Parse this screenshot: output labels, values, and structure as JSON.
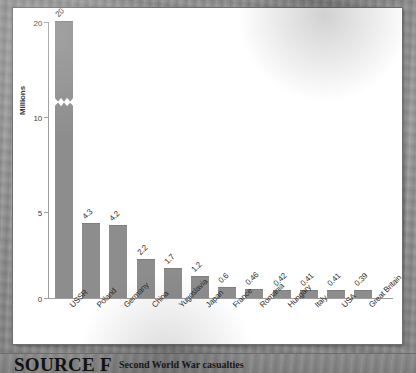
{
  "source": {
    "label": "SOURCE F",
    "caption": "Second World War casualties"
  },
  "chart_data": {
    "type": "bar",
    "title": "",
    "xlabel": "",
    "ylabel": "Millions",
    "ylim": [
      0,
      20
    ],
    "y_ticks": [
      "0",
      "5",
      "10",
      "20"
    ],
    "axis_break": {
      "present": true,
      "between": [
        10,
        20
      ],
      "note": "y-axis broken between 10 and 20; USSR bar drawn with zigzag break"
    },
    "grid": false,
    "legend": "none",
    "categories": [
      "USSR",
      "Poland",
      "Germany",
      "China",
      "Yugoslavia",
      "Japan",
      "France",
      "Romania",
      "Hungary",
      "Italy",
      "USA",
      "Great Britain"
    ],
    "values": [
      20,
      4.3,
      4.2,
      2.2,
      1.7,
      1.2,
      0.6,
      0.46,
      0.42,
      0.41,
      0.41,
      0.39
    ],
    "value_labels": [
      "20",
      "4.3",
      "4.2",
      "2.2",
      "1.7",
      "1.2",
      "0.6",
      "0.46",
      "0.42",
      "0.41",
      "0.41",
      "0.39"
    ],
    "bar_color": "#8d8d8d",
    "panel_color": "#ffffff",
    "background_color": "#8e8e8e"
  }
}
